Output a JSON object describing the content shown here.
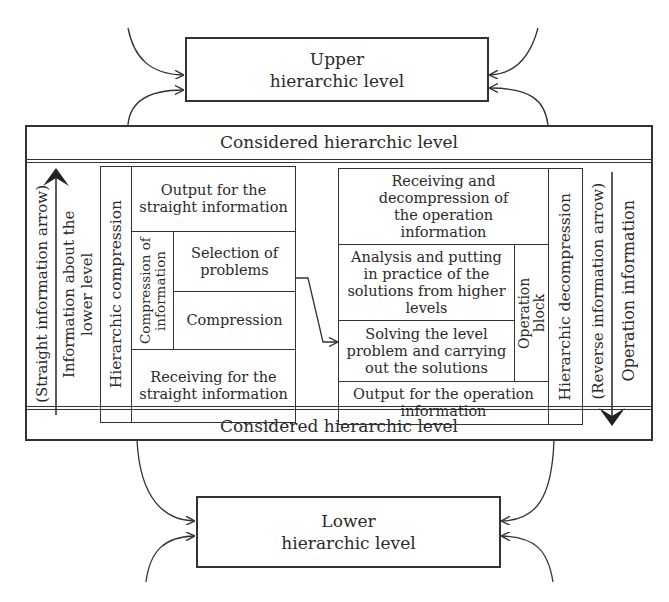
{
  "upper_level": {
    "label": "Upper hierarchic level"
  },
  "considered_level": {
    "top_label": "Considered hierarchic level",
    "bottom_label": "Considered hierarchic level"
  },
  "lower_level": {
    "label": "Lower hierarchic level"
  },
  "left_side": {
    "straight_arrow_label": "(Straight information arrow)",
    "info_lower_label": "Information about the lower level",
    "hierarchic_compression": "Hierarchic compression",
    "output_straight": "Output for the straight information",
    "compression_of_information": "Compression of information",
    "selection_of_problems": "Selection of problems",
    "compression": "Compression",
    "receiving_straight": "Receiving for the straight information"
  },
  "right_side": {
    "receiving_decompression": "Receiving and decompression of the operation information",
    "analysis": "Analysis and putting in practice of the solutions from higher levels",
    "solving": "Solving the level problem and carrying out the solutions",
    "operation_block": "Operation block",
    "output_operation": "Output for the operation information",
    "hierarchic_decompression": "Hierarchic decompression",
    "reverse_arrow_label": "(Reverse information arrow)",
    "operation_information": "Operation information"
  },
  "colors": {
    "line": "#333333",
    "background": "#ffffff",
    "text": "#2a2a2a"
  }
}
